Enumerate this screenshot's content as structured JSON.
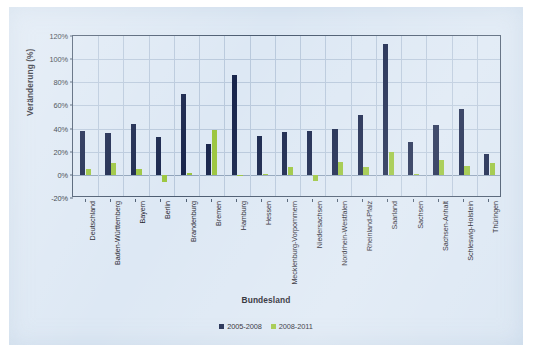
{
  "chart_data": {
    "type": "bar",
    "title": "",
    "xlabel": "Bundesland",
    "ylabel": "Veränderung (%)",
    "ylim": [
      -20,
      120
    ],
    "ytick_values": [
      120,
      100,
      80,
      60,
      40,
      20,
      0,
      -20
    ],
    "ytick_labels": [
      "120%",
      "100%",
      "80%",
      "60%",
      "40%",
      "20%",
      "0%",
      "-20%"
    ],
    "grid": true,
    "legend_position": "bottom",
    "categories": [
      "Deutschland",
      "Baden-Württemberg",
      "Bayern",
      "Berlin",
      "Brandenburg",
      "Bremen",
      "Hamburg",
      "Hessen",
      "Mecklenburg-Vorpommern",
      "Niedersachsen",
      "Nordrhein-Westfalen",
      "Rheinland-Pfalz",
      "Saarland",
      "Sachsen",
      "Sachsen-Anhalt",
      "Schleswig-Holstein",
      "Thüringen"
    ],
    "series": [
      {
        "name": "2005-2008",
        "color": "#18254c",
        "values": [
          38,
          36,
          44,
          33,
          70,
          27,
          86,
          34,
          37,
          38,
          40,
          52,
          113,
          28,
          43,
          57,
          18
        ]
      },
      {
        "name": "2008-2011",
        "color": "#9cc63f",
        "values": [
          5,
          10,
          5,
          -6,
          2,
          39,
          -1,
          1,
          7,
          -5,
          11,
          7,
          20,
          1,
          13,
          8,
          10
        ]
      }
    ]
  },
  "legend": {
    "items": [
      {
        "label": "2005-2008",
        "color": "#18254c"
      },
      {
        "label": "2008-2011",
        "color": "#9cc63f"
      }
    ]
  }
}
